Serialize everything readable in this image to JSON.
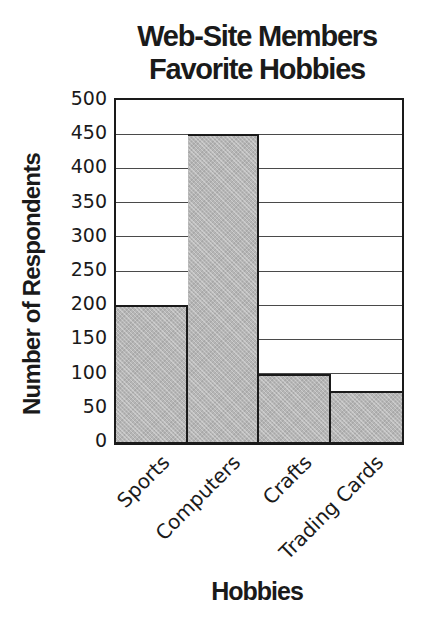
{
  "figure": {
    "background": "#ffffff"
  },
  "chart_data": {
    "type": "bar",
    "title": "Web-Site Members Favorite Hobbies",
    "title_lines": [
      "Web-Site Members",
      "Favorite Hobbies"
    ],
    "xlabel": "Hobbies",
    "ylabel": "Number of Respondents",
    "categories": [
      "Sports",
      "Computers",
      "Crafts",
      "Trading Cards"
    ],
    "values": [
      200,
      450,
      100,
      75
    ],
    "ylim": [
      0,
      500
    ],
    "ytick_step": 50,
    "yticks": [
      500,
      450,
      400,
      350,
      300,
      250,
      200,
      150,
      100,
      50,
      0
    ],
    "grid": true,
    "legend": "none",
    "bar_fill": "#b6b6b6",
    "bar_border": "#1a1a1a",
    "gridline_color": "#4a4a4a",
    "text_color": "#1a1a1a"
  }
}
